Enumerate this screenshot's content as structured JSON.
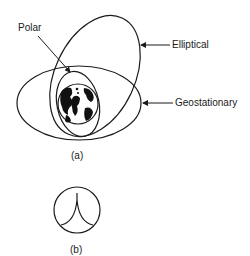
{
  "figure_a": {
    "label": "(a)",
    "orbits": [
      {
        "name": "Polar",
        "label": "Polar"
      },
      {
        "name": "Elliptical",
        "label": "Elliptical"
      },
      {
        "name": "Geostationary",
        "label": "Geostationary"
      }
    ],
    "center_body": "earth"
  },
  "figure_b": {
    "label": "(b)"
  },
  "colors": {
    "stroke": "#1a1a1a",
    "background": "#ffffff"
  }
}
